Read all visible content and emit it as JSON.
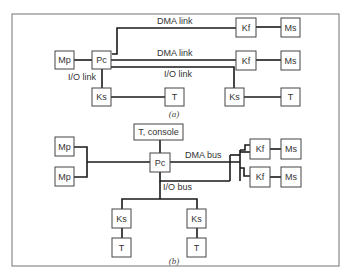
{
  "diagram_a": {
    "caption": "(a)",
    "boxes": {
      "mp": "Mp",
      "pc": "Pc",
      "kf1": "Kf",
      "ms1": "Ms",
      "kf2": "Kf",
      "ms2": "Ms",
      "ks_left": "Ks",
      "t_left": "T",
      "ks_right": "Ks",
      "t_right": "T"
    },
    "links": {
      "dma_link_1": "DMA link",
      "dma_link_2": "DMA link",
      "io_link_right": "I/O link",
      "io_link_left": "I/O link"
    }
  },
  "diagram_b": {
    "caption": "(b)",
    "boxes": {
      "t_console": "T, console",
      "pc": "Pc",
      "mp1": "Mp",
      "mp2": "Mp",
      "kf1": "Kf",
      "ms1": "Ms",
      "kf2": "Kf",
      "ms2": "Ms",
      "ks_left": "Ks",
      "t_left": "T",
      "ks_right": "Ks",
      "t_right": "T"
    },
    "buses": {
      "dma_bus": "DMA bus",
      "io_bus": "I/O bus"
    }
  }
}
